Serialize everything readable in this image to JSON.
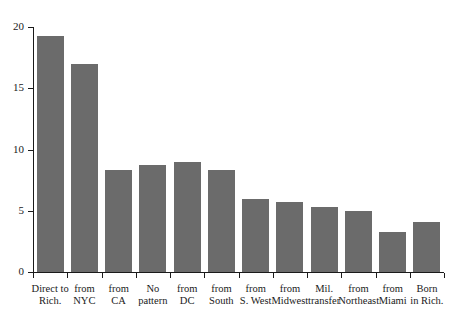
{
  "chart_data": {
    "type": "bar",
    "title": "",
    "subtitle": "",
    "xlabel": "",
    "ylabel": "",
    "categories": [
      "Direct to\nRich.",
      "from\nNYC",
      "from\nCA",
      "No\npattern",
      "from\nDC",
      "from\nSouth",
      "from\nS. West",
      "from\nMidwest",
      "Mil.\ntransfer",
      "from\nNortheast",
      "from\nMiami",
      "Born\nin Rich."
    ],
    "values": [
      19.3,
      17.0,
      8.3,
      8.7,
      9.0,
      8.3,
      6.0,
      5.7,
      5.3,
      5.0,
      3.3,
      4.1
    ],
    "ylim": [
      0,
      20
    ],
    "yticks": [
      0,
      5,
      10,
      15,
      20
    ],
    "ytick_labels": [
      "0",
      "5",
      "10",
      "15",
      "20"
    ],
    "grid": false,
    "legend": false,
    "bar_color": "#6b6b6b",
    "axis_color": "#1a1a1a",
    "background_color": "#ffffff"
  }
}
